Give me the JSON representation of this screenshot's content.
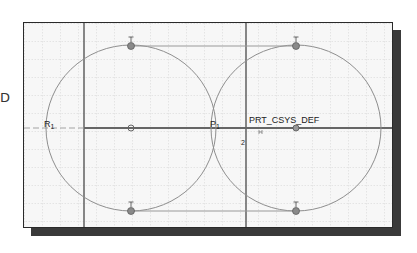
{
  "diagram": {
    "type": "cad-sketch",
    "edge_glyph": "D",
    "coordinate_system_label": "PRT_CSYS_DEF",
    "labels": {
      "r_label": "R",
      "r_sub": "1",
      "p_label": "P",
      "p_sub": "1",
      "axis_mark": "2",
      "h_mark": "H"
    },
    "constraint_symbols": {
      "tangent": "T"
    },
    "elements": {
      "circles": [
        {
          "name": "left-circle",
          "center": [
            130,
            127
          ],
          "rx": 85,
          "ry": 83
        },
        {
          "name": "right-circle",
          "center": [
            295,
            127
          ],
          "rx": 85,
          "ry": 83
        }
      ],
      "tangent_lines": [
        {
          "name": "top-tangent-line",
          "from": [
            130,
            45
          ],
          "to": [
            295,
            45
          ]
        },
        {
          "name": "bottom-tangent-line",
          "from": [
            130,
            210
          ],
          "to": [
            295,
            210
          ]
        }
      ],
      "reference_lines": [
        {
          "name": "vertical-reference-left",
          "x": 83
        },
        {
          "name": "vertical-reference-center",
          "x": 245
        },
        {
          "name": "horizontal-centerline",
          "y": 127
        }
      ]
    },
    "colors": {
      "grid": "#c8c8c8",
      "geometry": "#8a8a8a",
      "reference": "#555555",
      "frame_shadow": "#3a3a3a",
      "background": "#f7f7f7"
    }
  }
}
